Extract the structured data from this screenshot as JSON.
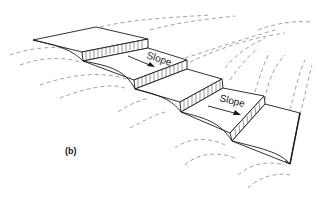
{
  "figure": {
    "caption": "(b)",
    "terraces": [
      {
        "id": "terrace-1",
        "slope_label": "Slope"
      },
      {
        "id": "terrace-2",
        "slope_label": "Slope"
      }
    ],
    "labels": {
      "slope_upper": "Slope",
      "slope_lower": "Slope"
    },
    "colors": {
      "line": "#1a1a1a",
      "dashed": "#7a7a7a",
      "background": "#ffffff"
    }
  }
}
